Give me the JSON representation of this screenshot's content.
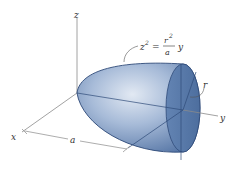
{
  "diagram": {
    "type": "paraboloid-of-revolution",
    "axes": {
      "z_label": "z",
      "y_label": "y",
      "x_label": "x"
    },
    "equation": {
      "lhs": "z",
      "lhs_exp": "2",
      "eq": "=",
      "num": "r",
      "num_exp": "2",
      "den": "a",
      "rhs_var": "y"
    },
    "dimensions": {
      "length_label": "a",
      "radius_label": "r"
    },
    "colors": {
      "solid_light": "#c9d6e8",
      "solid_mid": "#7d98c0",
      "solid_dark": "#4f6f9f",
      "face": "#5b7cab",
      "outline": "#2e4a78",
      "axis": "#8a8a8a"
    }
  }
}
